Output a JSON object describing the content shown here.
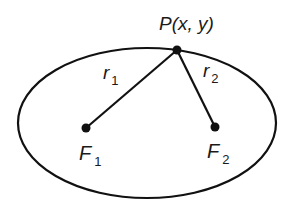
{
  "diagram": {
    "type": "ellipse-foci",
    "ellipse": {
      "cx": 147,
      "cy": 123,
      "rx": 129,
      "ry": 75,
      "stroke": "#111111"
    },
    "point": {
      "label": "P(x, y)",
      "x": 177,
      "y": 50
    },
    "foci": [
      {
        "label": "F",
        "subscript": "1",
        "x": 86,
        "y": 128
      },
      {
        "label": "F",
        "subscript": "2",
        "x": 215,
        "y": 127
      }
    ],
    "segments": [
      {
        "label": "r",
        "subscript": "1"
      },
      {
        "label": "r",
        "subscript": "2"
      }
    ]
  }
}
